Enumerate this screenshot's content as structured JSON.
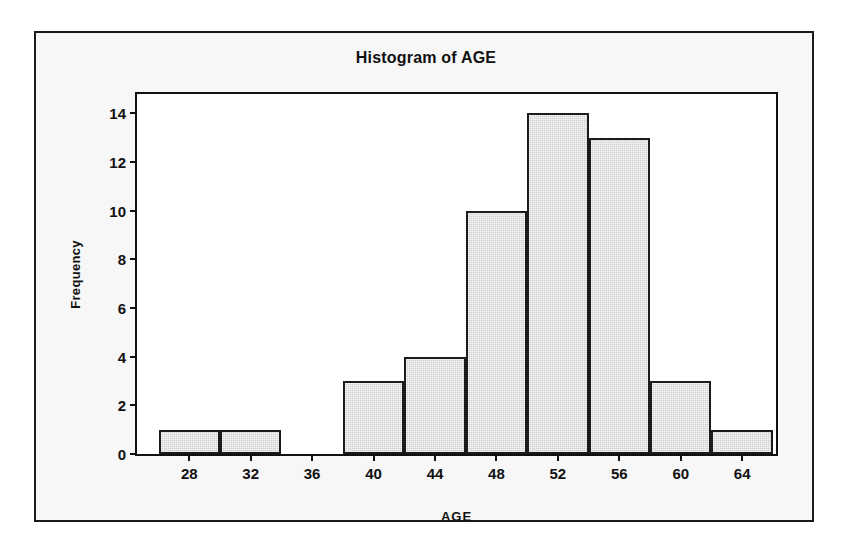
{
  "chart_data": {
    "type": "bar",
    "title": "Histogram of AGE",
    "xlabel": "AGE",
    "ylabel": "Frequency",
    "categories": [
      28,
      32,
      36,
      40,
      44,
      48,
      52,
      56,
      60,
      64
    ],
    "bin_width": 4,
    "bins": [
      {
        "center": 28,
        "start": 26,
        "end": 30,
        "value": 1
      },
      {
        "center": 32,
        "start": 30,
        "end": 34,
        "value": 1
      },
      {
        "center": 36,
        "start": 34,
        "end": 38,
        "value": 0
      },
      {
        "center": 40,
        "start": 38,
        "end": 42,
        "value": 3
      },
      {
        "center": 44,
        "start": 42,
        "end": 46,
        "value": 4
      },
      {
        "center": 48,
        "start": 46,
        "end": 50,
        "value": 10
      },
      {
        "center": 52,
        "start": 50,
        "end": 54,
        "value": 14
      },
      {
        "center": 56,
        "start": 54,
        "end": 58,
        "value": 13
      },
      {
        "center": 60,
        "start": 58,
        "end": 62,
        "value": 3
      },
      {
        "center": 64,
        "start": 62,
        "end": 66,
        "value": 1
      }
    ],
    "values": [
      1,
      1,
      0,
      3,
      4,
      10,
      14,
      13,
      3,
      1
    ],
    "xticks": [
      28,
      32,
      36,
      40,
      44,
      48,
      52,
      56,
      60,
      64
    ],
    "yticks": [
      0,
      2,
      4,
      6,
      8,
      10,
      12,
      14
    ],
    "xlim": [
      24.6,
      66.2
    ],
    "ylim": [
      0,
      14.8
    ],
    "grid": false,
    "legend": false,
    "bar_fill_color": "#cfcfcf",
    "bar_edge_color": "#1b1b1b",
    "plot_background": "#ffffff",
    "frame_background": "#f7f7f7",
    "frame_border_color": "#1a1a1a",
    "text_color": "#111111"
  }
}
